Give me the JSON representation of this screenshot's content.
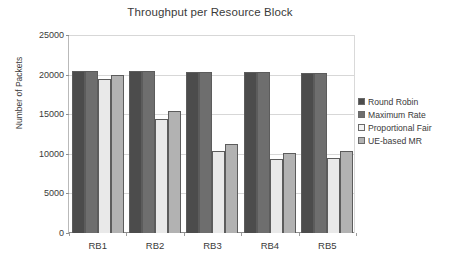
{
  "chart_data": {
    "type": "bar",
    "title": "Throughput per Resource Block",
    "xlabel": "",
    "ylabel": "Number of Packets",
    "categories": [
      "RB1",
      "RB2",
      "RB3",
      "RB4",
      "RB5"
    ],
    "ylim": [
      0,
      25000
    ],
    "yticks": [
      0,
      5000,
      10000,
      15000,
      20000,
      25000
    ],
    "ytick_labels": [
      "0",
      "5000",
      "10000",
      "15000",
      "20000",
      "25000"
    ],
    "grid": true,
    "legend_position": "right",
    "series": [
      {
        "name": "Round Robin",
        "color": "#4c4c4c",
        "values": [
          20400,
          20400,
          20350,
          20300,
          20250
        ]
      },
      {
        "name": "Maximum Rate",
        "color": "#6e6e6e",
        "values": [
          20400,
          20400,
          20350,
          20300,
          20250
        ]
      },
      {
        "name": "Proportional Fair",
        "color": "#e9e9e9",
        "values": [
          19400,
          14400,
          10400,
          9400,
          9500
        ]
      },
      {
        "name": "UE-based MR",
        "color": "#b2b2b2",
        "values": [
          20000,
          15400,
          11300,
          10100,
          10300
        ]
      }
    ]
  },
  "legend": {
    "items": [
      {
        "label": "Round Robin",
        "color": "#4c4c4c"
      },
      {
        "label": "Maximum Rate",
        "color": "#6e6e6e"
      },
      {
        "label": "Proportional Fair",
        "color": "#f4f4f4"
      },
      {
        "label": "UE-based MR",
        "color": "#b2b2b2"
      }
    ]
  }
}
